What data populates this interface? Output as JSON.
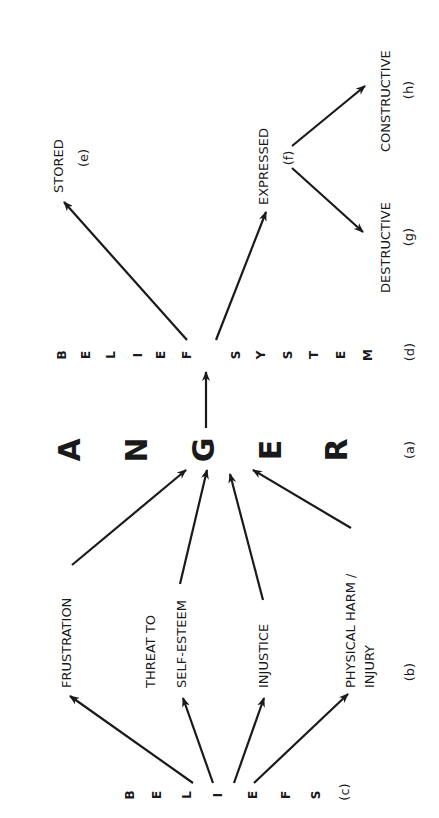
{
  "diagram": {
    "orientation": "rotated 90 degrees counterclockwise",
    "anger": {
      "letters": [
        "A",
        "N",
        "G",
        "E",
        "R"
      ],
      "tag": "(a)"
    },
    "triggers": {
      "tag": "(b)",
      "items": [
        {
          "line1": "FRUSTRATION",
          "line2": ""
        },
        {
          "line1": "THREAT TO",
          "line2": "SELF-ESTEEM"
        },
        {
          "line1": "INJUSTICE",
          "line2": ""
        },
        {
          "line1": "PHYSICAL HARM /",
          "line2": "INJURY"
        }
      ]
    },
    "beliefs": {
      "letters": [
        "B",
        "E",
        "L",
        "I",
        "E",
        "F",
        "S"
      ],
      "tag": "(c)"
    },
    "belief_system": {
      "letters": [
        "B",
        "E",
        "L",
        "I",
        "E",
        "F",
        "S",
        "Y",
        "S",
        "T",
        "E",
        "M"
      ],
      "tag": "(d)"
    },
    "outcomes": {
      "stored": {
        "label": "STORED",
        "tag": "(e)"
      },
      "expressed": {
        "label": "EXPRESSED",
        "tag": "(f)"
      },
      "destructive": {
        "label": "DESTRUCTIVE",
        "tag": "(g)"
      },
      "constructive": {
        "label": "CONSTRUCTIVE",
        "tag": "(h)"
      }
    },
    "colors": {
      "ink": "#1a1a1a",
      "background": "#ffffff"
    }
  }
}
